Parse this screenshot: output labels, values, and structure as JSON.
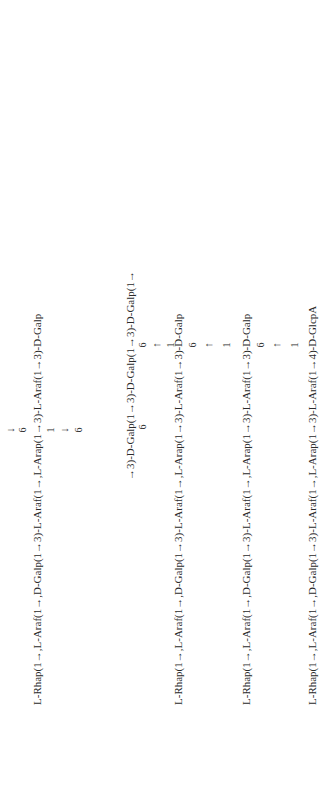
{
  "figure": {
    "backbone": {
      "text": "→3)-D-Galp(1→3)-D-Galp(1→3)-D-Galp(1→",
      "branch_positions": [
        "6",
        "6",
        "6"
      ]
    },
    "top_branch": {
      "arrow": "↓",
      "position_label": "6",
      "text": "L-Rhap(1→,L-Araf(1→,D-Galp(1→3)-L-Araf(1→,L-Arap(1→3)-L-Araf(1→3)-D-Galp",
      "link_from": "1",
      "link_arrow": "↓",
      "link_to": "6"
    },
    "side_chains": [
      {
        "text": "L-Rhap(1→,L-Araf(1→,D-Galp(1→3)-L-Araf(1→,L-Arap(1→3)-L-Araf(1→3)-D-Galp",
        "link_from": "1",
        "link_arrow": "↑",
        "link_to": "6"
      },
      {
        "text": "L-Rhap(1→,L-Araf(1→,D-Galp(1→3)-L-Araf(1→,L-Arap(1→3)-L-Araf(1→3)-D-Galp",
        "link_from": "1",
        "link_arrow": "↑",
        "link_to": "6"
      },
      {
        "text": "L-Rhap(1→,L-Araf(1→,D-Galp(1→3)-L-Araf(1→,L-Arap(1→3)-L-Araf(1→4)-D-GlcpA",
        "link_from": "1",
        "link_arrow": "↑",
        "link_to": "6"
      }
    ]
  }
}
